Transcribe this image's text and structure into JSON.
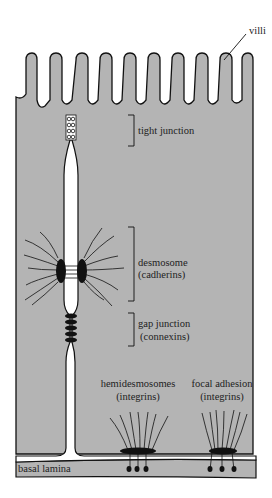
{
  "colors": {
    "cell": "#b4b4b4",
    "outline": "#111111",
    "background": "#ffffff"
  },
  "labels": {
    "villi": "villi",
    "tight_junction": "tight junction",
    "desmosome": "desmosome",
    "desmosome_protein": "(cadherins)",
    "gap_junction": "gap junction",
    "gap_junction_protein": "(connexins)",
    "hemidesmosomes": "hemidesmosomes",
    "hemidesmosomes_protein": "(integrins)",
    "focal_adhesion": "focal adhesion",
    "focal_adhesion_protein": "(integrins)",
    "basal_lamina": "basal lamina"
  }
}
